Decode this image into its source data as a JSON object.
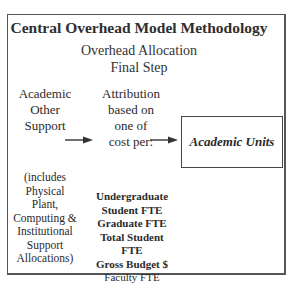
{
  "diagram": {
    "title": "Central Overhead Model Methodology",
    "subtitle": [
      "Overhead Allocation",
      "Final Step"
    ],
    "source_node": {
      "lines": [
        "Academic",
        "Other",
        "Support"
      ],
      "note_lines": [
        "(includes",
        "Physical",
        "Plant,",
        "Computing &",
        "Institutional",
        "Support",
        "Allocations)"
      ]
    },
    "attribution_node": {
      "lines": [
        "Attribution",
        "based on",
        "one of",
        "cost per:"
      ],
      "cost_bases": [
        {
          "label": "Undergraduate",
          "bold": true
        },
        {
          "label": "Student FTE",
          "bold": true
        },
        {
          "label": "Graduate FTE",
          "bold": true
        },
        {
          "label": "Total Student",
          "bold": true
        },
        {
          "label": "FTE",
          "bold": true
        },
        {
          "label": "Gross Budget $",
          "bold": true
        },
        {
          "label": "Faculty FTE",
          "bold": false
        }
      ]
    },
    "target_node": {
      "label": "Academic Units"
    },
    "edges": [
      {
        "from": "Academic Other Support",
        "to": "Attribution"
      },
      {
        "from": "Attribution",
        "to": "Academic Units"
      }
    ]
  }
}
